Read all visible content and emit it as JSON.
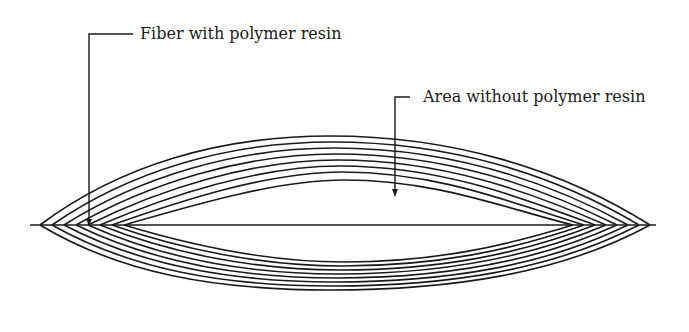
{
  "diagram": {
    "type": "cross-section schematic",
    "labels": {
      "fiber": "Fiber with polymer resin",
      "area": "Area without polymer resin"
    },
    "layers": {
      "top_count": 8,
      "bottom_count": 8
    },
    "colors": {
      "stroke": "#1a1a1a",
      "background": "#ffffff"
    }
  }
}
